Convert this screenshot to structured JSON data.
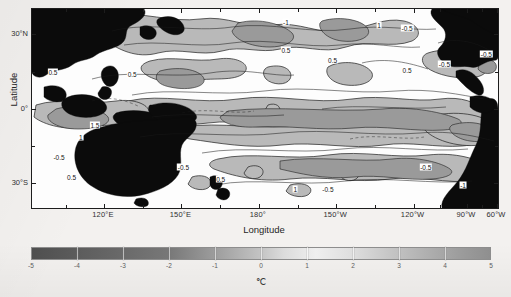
{
  "figure": {
    "type": "contour-map"
  },
  "axes": {
    "x_title": "Longitude",
    "y_title": "Latitude",
    "x_ticks": [
      {
        "label": "120°E",
        "value": 120,
        "pos": 0.1545
      },
      {
        "label": "150°E",
        "value": 150,
        "pos": 0.3206
      },
      {
        "label": "180°",
        "value": 180,
        "pos": 0.4867
      },
      {
        "label": "150°W",
        "value": 210,
        "pos": 0.6528
      },
      {
        "label": "120°W",
        "value": 240,
        "pos": 0.8189
      },
      {
        "label": "90°W",
        "value": 270,
        "pos": 0.9335
      },
      {
        "label": "60°W",
        "value": 300,
        "pos": 0.9979
      }
    ],
    "x_minor_positions": [
      0.072,
      0.238,
      0.404,
      0.57,
      0.736,
      0.876,
      0.966
    ],
    "y_ticks": [
      {
        "label": "30°N",
        "value": 30,
        "pos": 0.125
      },
      {
        "label": "0°",
        "value": 0,
        "pos": 0.505
      },
      {
        "label": "30°S",
        "value": -30,
        "pos": 0.875
      }
    ],
    "y_minor_positions": [
      0.315,
      0.69
    ],
    "x_range": [
      100,
      300
    ],
    "y_range": [
      -40,
      40
    ]
  },
  "colorbar": {
    "unit": "℃",
    "min": -5,
    "max": 5,
    "ticks": [
      "-5",
      "-4",
      "-3",
      "-2",
      "-1",
      "0",
      "1",
      "2",
      "3",
      "4",
      "5"
    ],
    "tick_values": [
      -5,
      -4,
      -3,
      -2,
      -1,
      0,
      1,
      2,
      3,
      4,
      5
    ],
    "orientation": "horizontal",
    "colors": {
      "neg_end": "#4d4d4d",
      "mid_light": "#f0f0f0",
      "pos_end": "#8f8f8f",
      "land": "#0d0d0d",
      "contour_line": "#1a1a1a"
    }
  },
  "chart_data": {
    "type": "heatmap",
    "title": "",
    "subtitle": "",
    "xlabel": "Longitude",
    "ylabel": "Latitude",
    "zlabel": "℃",
    "xlim": [
      100,
      300
    ],
    "ylim": [
      -40,
      40
    ],
    "zlim": [
      -5,
      5
    ],
    "grid": false,
    "legend": "colorbar-below",
    "xtick_labels": [
      "120°E",
      "150°E",
      "180°",
      "150°W",
      "120°W",
      "90°W",
      "60°W"
    ],
    "ytick_labels": [
      "30°N",
      "0°",
      "30°S"
    ],
    "colorbar_ticks": [
      -5,
      -4,
      -3,
      -2,
      -1,
      0,
      1,
      2,
      3,
      4,
      5
    ],
    "contour_levels": [
      -1.5,
      -1,
      -0.5,
      0.5,
      1,
      1.5
    ],
    "contour_labels_visible": [
      "-1",
      "-0.5",
      "0.5",
      "1",
      "1.5"
    ],
    "features": [
      {
        "name": "equatorial-warm-tongue",
        "region": "150°E–110°W, 5°S–5°N",
        "value": 1.0,
        "sign": "positive"
      },
      {
        "name": "maritime-continent-warm",
        "region": "110°E–140°E, 10°S–10°N",
        "value": 1.5,
        "sign": "positive"
      },
      {
        "name": "north-pacific-cool",
        "region": "160°E–160°W, 20°N–35°N",
        "value": -1.0,
        "sign": "negative"
      },
      {
        "name": "central-north-cool",
        "region": "180°–150°W, 15°N–25°N",
        "value": -0.5,
        "sign": "negative"
      },
      {
        "name": "south-pacific-cool",
        "region": "170°W–120°W, 15°S–30°S",
        "value": -0.5,
        "sign": "negative"
      },
      {
        "name": "eastern-boundary-cool",
        "region": "100°W–80°W, 10°S–30°S",
        "value": -0.5,
        "sign": "negative"
      }
    ]
  },
  "contour_labels": [
    {
      "text": "-1",
      "x": 0.545,
      "y": 0.065
    },
    {
      "text": "0.5",
      "x": 0.545,
      "y": 0.205
    },
    {
      "text": "0.5",
      "x": 0.645,
      "y": 0.255
    },
    {
      "text": "1",
      "x": 0.745,
      "y": 0.082
    },
    {
      "text": "-0.5",
      "x": 0.805,
      "y": 0.095
    },
    {
      "text": "-0.5",
      "x": 0.885,
      "y": 0.275
    },
    {
      "text": "0.5",
      "x": 0.805,
      "y": 0.305
    },
    {
      "text": "0.5",
      "x": 0.045,
      "y": 0.315
    },
    {
      "text": "0.5",
      "x": 0.215,
      "y": 0.325
    },
    {
      "text": "1.5",
      "x": 0.135,
      "y": 0.585
    },
    {
      "text": "1",
      "x": 0.105,
      "y": 0.645
    },
    {
      "text": "-0.5",
      "x": 0.058,
      "y": 0.745
    },
    {
      "text": "0.5",
      "x": 0.085,
      "y": 0.845
    },
    {
      "text": "-0.5",
      "x": 0.325,
      "y": 0.795
    },
    {
      "text": "0.5",
      "x": 0.405,
      "y": 0.855
    },
    {
      "text": "1",
      "x": 0.565,
      "y": 0.905
    },
    {
      "text": "-0.5",
      "x": 0.635,
      "y": 0.905
    },
    {
      "text": "-0.5",
      "x": 0.845,
      "y": 0.795
    },
    {
      "text": "-1",
      "x": 0.925,
      "y": 0.885
    },
    {
      "text": "-0.5",
      "x": 0.975,
      "y": 0.225
    }
  ]
}
